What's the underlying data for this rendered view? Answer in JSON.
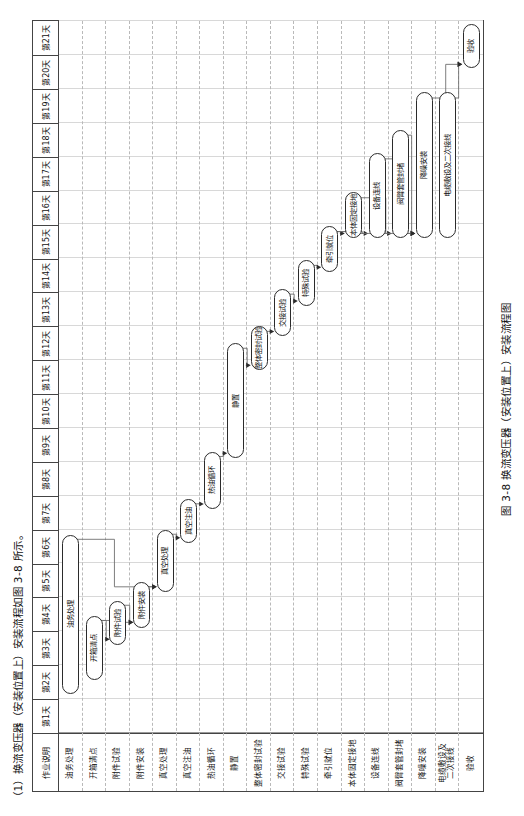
{
  "captions": {
    "top": "（1）换流变压器（安装位置上）安装流程如图 3-8 所示。",
    "bottom": "图 3-8  换流变压器（安装位置上）安装流程图"
  },
  "chart_data": {
    "type": "bar",
    "title": "换流变压器（安装位置上）安装流程图",
    "xlabel": "作业天数",
    "ylabel": "作业说明",
    "grid": true,
    "legend": "none",
    "xlim": [
      0,
      21
    ],
    "columns": [
      "作业说明",
      "第1天",
      "第2天",
      "第3天",
      "第4天",
      "第5天",
      "第6天",
      "第7天",
      "第8天",
      "第9天",
      "第10天",
      "第11天",
      "第12天",
      "第13天",
      "第14天",
      "第15天",
      "第16天",
      "第17天",
      "第18天",
      "第19天",
      "第20天",
      "第21天"
    ],
    "categories": [
      "油务处理",
      "开箱清点",
      "附件试验",
      "附件安装",
      "真空处理",
      "真空注油",
      "热油循环",
      "静置",
      "整体密封试验",
      "交接试验",
      "特殊试验",
      "牵引就位",
      "本体固定接地",
      "设备连线",
      "阀臂套管封堵",
      "降噪安装",
      "电缆敷设及\n二次接线",
      "验收"
    ],
    "tasks": [
      {
        "name": "油务处理",
        "label": "油务处理",
        "start": 1.15,
        "end": 5.85,
        "row": 0,
        "lines": 1
      },
      {
        "name": "开箱清点",
        "label": "开箱清点",
        "start": 1.55,
        "end": 3.45,
        "row": 1,
        "lines": 1
      },
      {
        "name": "附件试验",
        "label": "附件试验",
        "start": 2.6,
        "end": 3.9,
        "row": 2,
        "lines": 1
      },
      {
        "name": "附件安装",
        "label": "附件安装",
        "start": 3.1,
        "end": 4.45,
        "row": 3,
        "lines": 1
      },
      {
        "name": "真空处理",
        "label": "真空处理",
        "start": 4.15,
        "end": 6.0,
        "row": 4,
        "lines": 1
      },
      {
        "name": "真空注油",
        "label": "真空注油",
        "start": 5.6,
        "end": 6.9,
        "row": 5,
        "lines": 1
      },
      {
        "name": "热油循环",
        "label": "热油循环",
        "start": 6.6,
        "end": 8.3,
        "row": 6,
        "lines": 1
      },
      {
        "name": "静置",
        "label": "静置",
        "start": 8.1,
        "end": 11.5,
        "row": 7,
        "lines": 1
      },
      {
        "name": "整体密封试验",
        "label": "整体密封试验",
        "start": 10.7,
        "end": 12.0,
        "row": 8,
        "lines": 1
      },
      {
        "name": "交接试验",
        "label": "交接试验",
        "start": 11.7,
        "end": 13.1,
        "row": 9,
        "lines": 1
      },
      {
        "name": "特殊试验",
        "label": "特殊试验",
        "start": 12.6,
        "end": 13.95,
        "row": 10,
        "lines": 1
      },
      {
        "name": "牵引就位",
        "label": "牵引就位",
        "start": 13.6,
        "end": 14.95,
        "row": 11,
        "lines": 1
      },
      {
        "name": "本体固定接地",
        "label": "本体固定接地",
        "start": 14.6,
        "end": 15.95,
        "row": 12,
        "lines": 1
      },
      {
        "name": "设备连线",
        "label": "设备连线",
        "start": 14.6,
        "end": 17.1,
        "row": 13,
        "lines": 1
      },
      {
        "name": "阀臂套管封堵",
        "label": "阀臂套管封堵",
        "start": 14.6,
        "end": 17.8,
        "row": 14,
        "lines": 1
      },
      {
        "name": "降噪安装",
        "label": "降噪安装",
        "start": 14.6,
        "end": 18.9,
        "row": 15,
        "lines": 1
      },
      {
        "name": "电缆敷设及二次接线",
        "label": "电缆敷设及二次接线",
        "start": 14.6,
        "end": 18.9,
        "row": 16,
        "lines": 1
      },
      {
        "name": "验收",
        "label": "验收",
        "start": 19.6,
        "end": 20.9,
        "row": 17,
        "lines": 1
      }
    ],
    "links": [
      {
        "from": 0,
        "to": 4
      },
      {
        "from": 1,
        "to": 2
      },
      {
        "from": 1,
        "to": 3
      },
      {
        "from": 2,
        "to": 3
      },
      {
        "from": 3,
        "to": 4
      },
      {
        "from": 4,
        "to": 5
      },
      {
        "from": 5,
        "to": 6
      },
      {
        "from": 6,
        "to": 7
      },
      {
        "from": 7,
        "to": 8
      },
      {
        "from": 8,
        "to": 9
      },
      {
        "from": 9,
        "to": 10
      },
      {
        "from": 10,
        "to": 11
      },
      {
        "from": 11,
        "to": 12
      },
      {
        "from": 11,
        "to": 13
      },
      {
        "from": 11,
        "to": 14
      },
      {
        "from": 12,
        "to": 15
      },
      {
        "from": 13,
        "to": 15
      },
      {
        "from": 14,
        "to": 15
      },
      {
        "from": 15,
        "to": 17
      },
      {
        "from": 16,
        "to": 17
      }
    ]
  }
}
